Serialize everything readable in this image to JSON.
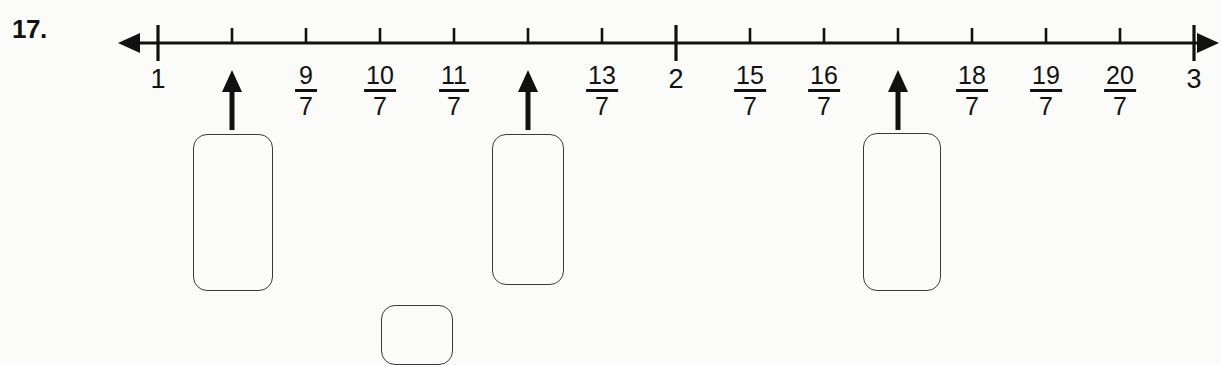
{
  "problem": {
    "number_label": "17."
  },
  "chart_data": {
    "type": "numberline",
    "title": "",
    "xlabel": "",
    "ylabel": "",
    "axis_range": [
      1,
      3
    ],
    "denominator": 7,
    "grid": false,
    "legend": "none",
    "tick_labels": [
      {
        "value": 1,
        "text": "1",
        "kind": "integer",
        "x": 158
      },
      {
        "value": 1.142857,
        "text": "8/7",
        "kind": "hidden",
        "x": 232
      },
      {
        "value": 1.285714,
        "text": "9",
        "denominator": "7",
        "kind": "fraction",
        "x": 306
      },
      {
        "value": 1.428571,
        "text": "10",
        "denominator": "7",
        "kind": "fraction",
        "x": 380
      },
      {
        "value": 1.571428,
        "text": "11",
        "denominator": "7",
        "kind": "fraction",
        "x": 454
      },
      {
        "value": 1.714285,
        "text": "12/7",
        "kind": "hidden",
        "x": 528
      },
      {
        "value": 1.857142,
        "text": "13",
        "denominator": "7",
        "kind": "fraction",
        "x": 602
      },
      {
        "value": 2,
        "text": "2",
        "kind": "integer",
        "x": 676
      },
      {
        "value": 2.142857,
        "text": "15",
        "denominator": "7",
        "kind": "fraction",
        "x": 750
      },
      {
        "value": 2.285714,
        "text": "16",
        "denominator": "7",
        "kind": "fraction",
        "x": 824
      },
      {
        "value": 2.428571,
        "text": "17/7",
        "kind": "hidden",
        "x": 898
      },
      {
        "value": 2.571428,
        "text": "18",
        "denominator": "7",
        "kind": "fraction",
        "x": 972
      },
      {
        "value": 2.714285,
        "text": "19",
        "denominator": "7",
        "kind": "fraction",
        "x": 1046
      },
      {
        "value": 2.857142,
        "text": "20",
        "denominator": "7",
        "kind": "fraction",
        "x": 1120
      },
      {
        "value": 3,
        "text": "3",
        "kind": "integer",
        "x": 1194
      }
    ],
    "markers": [
      {
        "name": "pointer-1",
        "value": 1.142857,
        "x": 232,
        "answer": ""
      },
      {
        "name": "pointer-2",
        "value": 1.714285,
        "x": 528,
        "answer": ""
      },
      {
        "name": "pointer-3",
        "value": 2.428571,
        "x": 898,
        "answer": ""
      }
    ],
    "answer_boxes": [
      {
        "name": "answer-box-1",
        "value": "",
        "x": 193,
        "y": 134,
        "w": 80,
        "h": 157
      },
      {
        "name": "answer-box-2",
        "value": "",
        "x": 492,
        "y": 134,
        "w": 72,
        "h": 151
      },
      {
        "name": "answer-box-3",
        "value": "",
        "x": 863,
        "y": 133,
        "w": 78,
        "h": 158
      },
      {
        "name": "answer-box-4",
        "value": "",
        "x": 381,
        "y": 305,
        "w": 72,
        "h": 60
      }
    ],
    "colors": {
      "ink": "#111111",
      "box_stroke": "#3a3a3a",
      "background": "#fbfbfa"
    }
  }
}
